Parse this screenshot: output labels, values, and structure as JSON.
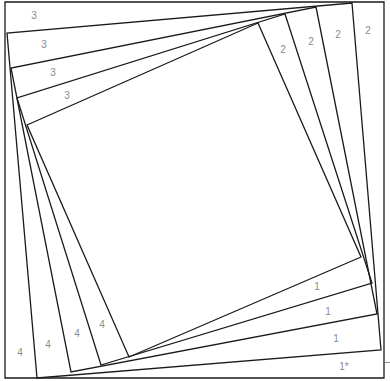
{
  "diagram": {
    "type": "twisted-square-foundation-pattern",
    "stroke_color": "#1a1a1a",
    "label_color": "#8a8a8a",
    "frame": [
      [
        5,
        2
      ],
      [
        384,
        2
      ],
      [
        384,
        378
      ],
      [
        5,
        378
      ]
    ],
    "squares": [
      [
        [
          352,
          3
        ],
        [
          381,
          350
        ],
        [
          37,
          378
        ],
        [
          7,
          33
        ]
      ],
      [
        [
          316,
          7
        ],
        [
          377,
          314
        ],
        [
          71,
          372
        ],
        [
          11,
          68
        ]
      ],
      [
        [
          285,
          14
        ],
        [
          372,
          283
        ],
        [
          101,
          365
        ],
        [
          17,
          98
        ]
      ],
      [
        [
          258,
          23
        ],
        [
          361,
          257
        ],
        [
          129,
          357
        ],
        [
          27,
          125
        ]
      ]
    ],
    "labels": {
      "top_left": [
        "3",
        "3",
        "3",
        "3"
      ],
      "top_right": [
        "2",
        "2",
        "2",
        "2"
      ],
      "bottom_right": [
        "1",
        "1",
        "1",
        "1*"
      ],
      "bottom_left": [
        "4",
        "4",
        "4",
        "4"
      ]
    }
  }
}
